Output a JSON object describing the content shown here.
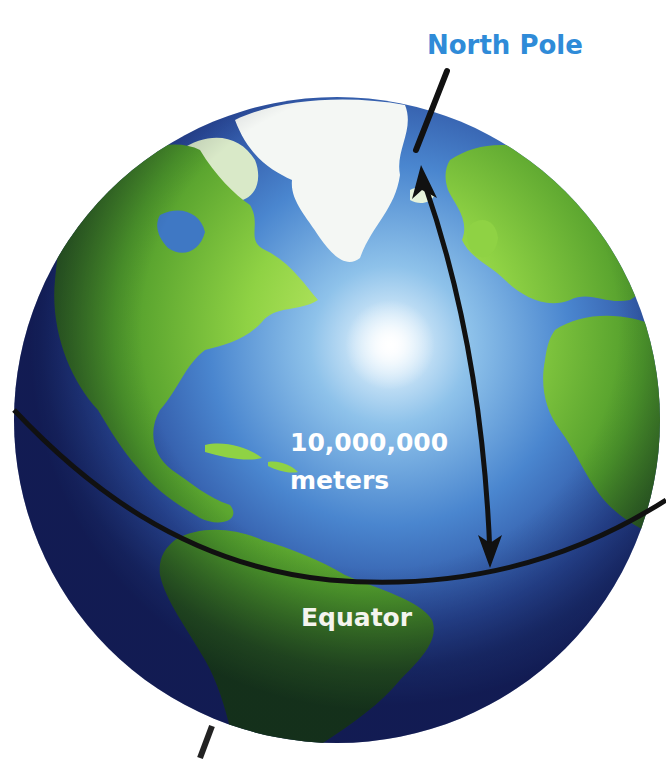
{
  "figure": {
    "labels": {
      "north_pole": "North Pole",
      "distance_value": "10,000,000",
      "distance_unit": "meters",
      "equator": "Equator"
    },
    "colors": {
      "north_pole_label": "#2f8bd8",
      "annotation_text": "#ffffff",
      "ocean_light": "#8fc3ea",
      "ocean_dark": "#1f2f7a",
      "land": "#7cc83a",
      "ice": "#f4f7f4",
      "lines": "#111111"
    },
    "annotations": [
      {
        "type": "pole-axis-line",
        "description": "axis line through North Pole"
      },
      {
        "type": "double-arrow",
        "from": "Equator",
        "to": "North Pole",
        "description": "10,000,000 meters"
      },
      {
        "type": "equator-line"
      },
      {
        "type": "south-axis-line"
      }
    ]
  }
}
